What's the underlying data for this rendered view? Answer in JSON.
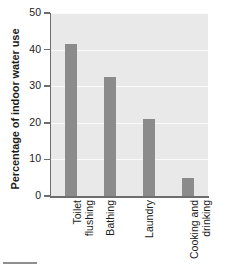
{
  "chart_data": {
    "type": "bar",
    "title": "",
    "xlabel": "",
    "ylabel": "Percentage of indoor water use",
    "categories": [
      "Toilet flushing",
      "Bathing",
      "Laundry",
      "Cooking and drinking"
    ],
    "category_lines": [
      [
        "Toilet",
        "flushing"
      ],
      [
        "Bathing"
      ],
      [
        "Laundry"
      ],
      [
        "Cooking and",
        "drinking"
      ]
    ],
    "values": [
      41.5,
      32.5,
      21,
      5
    ],
    "ylim": [
      0,
      50
    ],
    "yticks": [
      0,
      10,
      20,
      30,
      40,
      50
    ],
    "ytick_labels": [
      "0",
      "10",
      "20",
      "30",
      "40",
      "50"
    ],
    "grid": true,
    "legend": "none",
    "colors": {
      "bar": "#8b8b8b",
      "plot_background": "#e9e9e9",
      "gridline": "#fafafa",
      "axis": "#6d6d6d",
      "text": "#1b1b1b",
      "figure_background": "#ffffff"
    }
  }
}
